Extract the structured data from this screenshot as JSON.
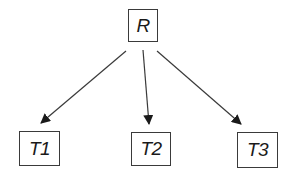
{
  "diagram": {
    "type": "tree",
    "root": {
      "id": "R",
      "label": "R"
    },
    "children": [
      {
        "id": "T1",
        "label": "T1"
      },
      {
        "id": "T2",
        "label": "T2"
      },
      {
        "id": "T3",
        "label": "T3"
      }
    ],
    "edges": [
      {
        "from": "R",
        "to": "T1",
        "style": "arrow"
      },
      {
        "from": "R",
        "to": "T2",
        "style": "arrow"
      },
      {
        "from": "R",
        "to": "T3",
        "style": "arrow"
      }
    ],
    "colors": {
      "line": "#3a3a3a",
      "text": "#1a1a1a",
      "background": "#ffffff"
    }
  }
}
